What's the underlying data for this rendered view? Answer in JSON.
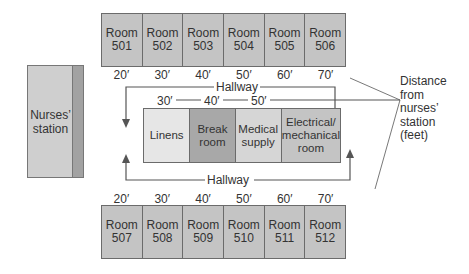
{
  "diagram": {
    "top_rooms": [
      {
        "line1": "Room",
        "line2": "501"
      },
      {
        "line1": "Room",
        "line2": "502"
      },
      {
        "line1": "Room",
        "line2": "503"
      },
      {
        "line1": "Room",
        "line2": "504"
      },
      {
        "line1": "Room",
        "line2": "505"
      },
      {
        "line1": "Room",
        "line2": "506"
      }
    ],
    "top_distances": [
      "20′",
      "30′",
      "40′",
      "50′",
      "60′",
      "70′"
    ],
    "bottom_rooms": [
      {
        "line1": "Room",
        "line2": "507"
      },
      {
        "line1": "Room",
        "line2": "508"
      },
      {
        "line1": "Room",
        "line2": "509"
      },
      {
        "line1": "Room",
        "line2": "510"
      },
      {
        "line1": "Room",
        "line2": "511"
      },
      {
        "line1": "Room",
        "line2": "512"
      }
    ],
    "bottom_distances": [
      "20′",
      "30′",
      "40′",
      "50′",
      "60′",
      "70′"
    ],
    "core_rooms": [
      {
        "line1": "Linens",
        "line2": "",
        "line3": "",
        "color": "#e6e6e6"
      },
      {
        "line1": "Break",
        "line2": "room",
        "line3": "",
        "color": "#a8a8a8"
      },
      {
        "line1": "Medical",
        "line2": "supply",
        "line3": "",
        "color": "#d6d6d6"
      },
      {
        "line1": "Electrical/",
        "line2": "mechanical",
        "line3": "room",
        "color": "#c4c4c4"
      }
    ],
    "core_distances": [
      "30′",
      "40′",
      "50′"
    ],
    "hallway_top_label": "Hallway",
    "hallway_bottom_label": "Hallway",
    "nurses_station": {
      "line1": "Nurses’",
      "line2": "station"
    },
    "legend": {
      "line1": "Distance",
      "line2": "from",
      "line3": "nurses’",
      "line4": "station",
      "line5": "(feet)"
    }
  }
}
